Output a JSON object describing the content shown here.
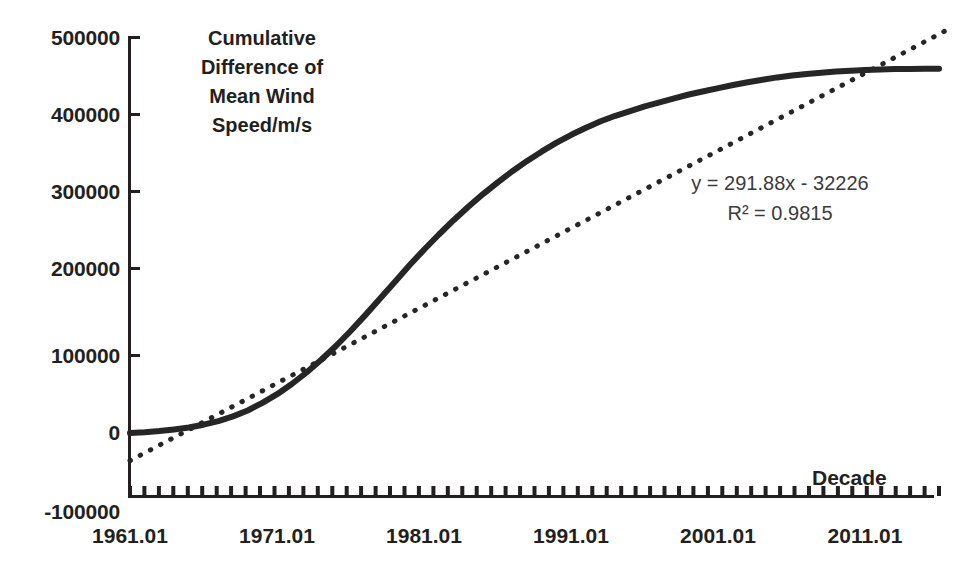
{
  "chart_data": {
    "type": "line",
    "title": "Cumulative Difference of Mean Wind Speed/m/s",
    "title_lines": [
      "Cumulative",
      "Difference of",
      "Mean Wind",
      "Speed/m/s"
    ],
    "xlabel": "Decade",
    "ylabel": "Cumulative Difference of Mean Wind Speed/m/s",
    "xlim": [
      1961.01,
      2016.01
    ],
    "ylim": [
      -100000,
      500000
    ],
    "grid": false,
    "legend": "none",
    "y_ticks": [
      500000,
      400000,
      300000,
      200000,
      100000,
      0,
      -100000
    ],
    "y_tick_labels": [
      "500000",
      "400000",
      "300000",
      "200000",
      "100000",
      "0",
      "-100000"
    ],
    "x_tick_labels": [
      "1961.01",
      "1971.01",
      "1981.01",
      "1991.01",
      "2001.01",
      "2011.01"
    ],
    "x_tick_values": [
      1961.01,
      1971.01,
      1981.01,
      1991.01,
      2001.01,
      2011.01
    ],
    "x_minor_tick_count": 57,
    "annotations": {
      "equation": "y = 291.88x - 32226",
      "r_squared": "R² = 0.9815",
      "slope": 291.88,
      "intercept": -32226,
      "r2": 0.9815
    },
    "series": [
      {
        "name": "Cumulative difference of mean wind speed",
        "style": "solid",
        "color": "#262626",
        "x": [
          1961.01,
          1962.01,
          1963.01,
          1964.01,
          1965.01,
          1966.01,
          1967.01,
          1968.01,
          1969.01,
          1970.01,
          1971.01,
          1972.01,
          1973.01,
          1974.01,
          1975.01,
          1976.01,
          1977.01,
          1978.01,
          1979.01,
          1980.01,
          1981.01,
          1982.01,
          1983.01,
          1984.01,
          1985.01,
          1986.01,
          1987.01,
          1988.01,
          1989.01,
          1990.01,
          1991.01,
          1992.01,
          1993.01,
          1994.01,
          1995.01,
          1996.01,
          1997.01,
          1998.01,
          1999.01,
          2000.01,
          2001.01,
          2002.01,
          2003.01,
          2004.01,
          2005.01,
          2006.01,
          2007.01,
          2008.01,
          2009.01,
          2010.01,
          2011.01,
          2012.01,
          2013.01,
          2014.01,
          2015.01,
          2016.01
        ],
        "y": [
          0,
          1000,
          2500,
          4500,
          7000,
          10500,
          15000,
          21000,
          28500,
          38000,
          49000,
          62000,
          76500,
          92500,
          110000,
          129000,
          149000,
          170000,
          191000,
          212000,
          232000,
          251000,
          269000,
          286000,
          302000,
          317000,
          331000,
          344000,
          356000,
          367000,
          377000,
          386000,
          394000,
          401000,
          407000,
          413000,
          418000,
          423000,
          428000,
          432000,
          436000,
          440000,
          443500,
          446500,
          449500,
          452000,
          454000,
          455500,
          457000,
          458000,
          459000,
          459500,
          460000,
          460300,
          460500,
          460600
        ]
      },
      {
        "name": "Linear trendline",
        "style": "dotted",
        "color": "#262626",
        "x": [
          1961.01,
          2016.6
        ],
        "y": [
          -35000,
          510000
        ]
      }
    ]
  },
  "axis": {
    "y_label_positions": [
      38,
      115,
      192,
      269,
      356,
      433,
      497
    ],
    "x_label_positions": [
      130,
      277,
      424,
      571,
      718,
      865
    ]
  }
}
